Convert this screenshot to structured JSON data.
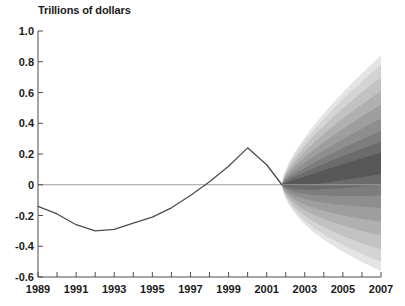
{
  "chart_data": {
    "type": "area",
    "title": "Trillions of dollars",
    "subtitle": "",
    "xlabel": "",
    "ylabel": "Trillions of dollars",
    "xlim": [
      1989,
      2007
    ],
    "ylim": [
      -0.6,
      1.0
    ],
    "grid": false,
    "legend": "none",
    "zero_line": true,
    "x_tick_labels": [
      "1989",
      "1991",
      "1993",
      "1995",
      "1997",
      "1999",
      "2001",
      "2003",
      "2005",
      "2007"
    ],
    "x_tick_values": [
      1989,
      1991,
      1993,
      1995,
      1997,
      1999,
      2001,
      2003,
      2005,
      2007
    ],
    "x_minor_tick_values": [
      1990,
      1992,
      1994,
      1996,
      1998,
      2000,
      2002,
      2004,
      2006
    ],
    "y_tick_labels": [
      "1.0",
      "0.8",
      "0.6",
      "0.4",
      "0.2",
      "0",
      "-0.2",
      "-0.4",
      "-0.6"
    ],
    "y_tick_values": [
      1.0,
      0.8,
      0.6,
      0.4,
      0.2,
      0,
      -0.2,
      -0.4,
      -0.6
    ],
    "series": [
      {
        "name": "Actual",
        "type": "line",
        "color": "#4d4d4d",
        "x": [
          1989,
          1990,
          1991,
          1992,
          1993,
          1994,
          1995,
          1996,
          1997,
          1998,
          1999,
          2000,
          2001,
          2001.8
        ],
        "values": [
          -0.14,
          -0.19,
          -0.26,
          -0.3,
          -0.29,
          -0.25,
          -0.21,
          -0.15,
          -0.07,
          0.02,
          0.12,
          0.24,
          0.13,
          0.0
        ]
      },
      {
        "name": "Projection uncertainty fan",
        "type": "fan",
        "start_year": 2001.8,
        "end_year": 2007,
        "center_values": [
          0.0,
          0.02,
          0.05,
          0.08,
          0.11,
          0.14
        ],
        "band_count": 9,
        "bands": [
          {
            "label": "innermost",
            "half_width_end": 0.07,
            "gray": "#575757"
          },
          {
            "label": "band-2",
            "half_width_end": 0.14,
            "gray": "#6b6b6b"
          },
          {
            "label": "band-3",
            "half_width_end": 0.21,
            "gray": "#7d7d7d"
          },
          {
            "label": "band-4",
            "half_width_end": 0.29,
            "gray": "#8e8e8e"
          },
          {
            "label": "band-5",
            "half_width_end": 0.38,
            "gray": "#9e9e9e"
          },
          {
            "label": "band-6",
            "half_width_end": 0.47,
            "gray": "#b0b0b0"
          },
          {
            "label": "band-7",
            "half_width_end": 0.56,
            "gray": "#c2c2c2"
          },
          {
            "label": "band-8",
            "half_width_end": 0.64,
            "gray": "#d4d4d4"
          },
          {
            "label": "outermost",
            "half_width_end": 0.7,
            "gray": "#e4e4e4"
          }
        ]
      }
    ]
  },
  "colors": {
    "axis": "#4d4d4d",
    "zero_line": "#9a9a9a",
    "line": "#4d4d4d",
    "text": "#1a1a1a",
    "background": "#ffffff"
  }
}
